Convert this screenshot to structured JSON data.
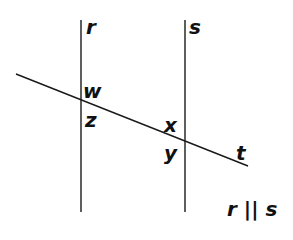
{
  "diagram": {
    "type": "parallel-lines-transversal",
    "lines": {
      "r": {
        "label": "r",
        "x1": 81,
        "y1": 20,
        "x2": 81,
        "y2": 212
      },
      "s": {
        "label": "s",
        "x1": 185,
        "y1": 20,
        "x2": 185,
        "y2": 212
      },
      "t": {
        "label": "t",
        "x1": 16,
        "y1": 74,
        "x2": 248,
        "y2": 166
      }
    },
    "angle_labels": {
      "w": "w",
      "z": "z",
      "x": "x",
      "y": "y"
    },
    "line_labels": {
      "r": "r",
      "s": "s",
      "t": "t"
    },
    "statement": "r || s",
    "colors": {
      "stroke": "#1a1a1a",
      "text": "#111111",
      "background": "#ffffff"
    }
  }
}
